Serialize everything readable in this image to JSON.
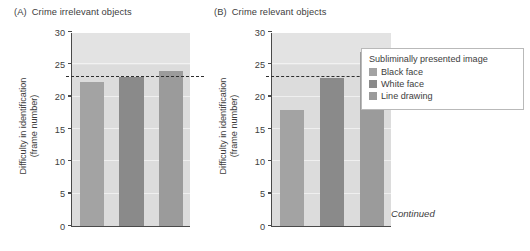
{
  "figure": {
    "continued_note": "Continued"
  },
  "legend": {
    "title": "Subliminally presented image",
    "items": [
      {
        "label": "Black face",
        "color": "#a3a3a3"
      },
      {
        "label": "White face",
        "color": "#8a8a8a"
      },
      {
        "label": "Line drawing",
        "color": "#9b9b9b"
      }
    ]
  },
  "panels": [
    {
      "letter": "(A)",
      "title": "Crime irrelevant objects"
    },
    {
      "letter": "(B)",
      "title": "Crime relevant objects"
    }
  ],
  "chart_data": [
    {
      "type": "bar",
      "title": "(A) Crime irrelevant objects",
      "xlabel": "",
      "ylabel": "Difficulty in identification (frame number)",
      "ylabel_line1": "Difficulty in identification",
      "ylabel_line2": "(frame number)",
      "ylim": [
        0,
        30
      ],
      "yticks": [
        0,
        5,
        10,
        15,
        20,
        25,
        30
      ],
      "ytick_labels": [
        "0",
        "5",
        "10",
        "15",
        "20",
        "25",
        "30"
      ],
      "grid": false,
      "categories": [
        "Black face",
        "White face",
        "Line drawing"
      ],
      "values": [
        22.3,
        23.0,
        23.9
      ],
      "colors": [
        "#a3a3a3",
        "#8a8a8a",
        "#9b9b9b"
      ],
      "reference_line": {
        "value": 23,
        "style": "dashed",
        "color": "#2e2e2e"
      },
      "plot_background": "#dcdcdc"
    },
    {
      "type": "bar",
      "title": "(B) Crime relevant objects",
      "xlabel": "",
      "ylabel": "Difficulty in identification (frame number)",
      "ylabel_line1": "Difficulty in identification",
      "ylabel_line2": "(frame number)",
      "ylim": [
        0,
        30
      ],
      "yticks": [
        0,
        5,
        10,
        15,
        20,
        25,
        30
      ],
      "ytick_labels": [
        "0",
        "5",
        "10",
        "15",
        "20",
        "25",
        "30"
      ],
      "grid": false,
      "categories": [
        "Black face",
        "White face",
        "Line drawing"
      ],
      "values": [
        17.9,
        22.9,
        26.9
      ],
      "colors": [
        "#a3a3a3",
        "#8a8a8a",
        "#9b9b9b"
      ],
      "reference_line": {
        "value": 23,
        "style": "dashed",
        "color": "#2e2e2e"
      },
      "plot_background": "#dcdcdc"
    }
  ]
}
